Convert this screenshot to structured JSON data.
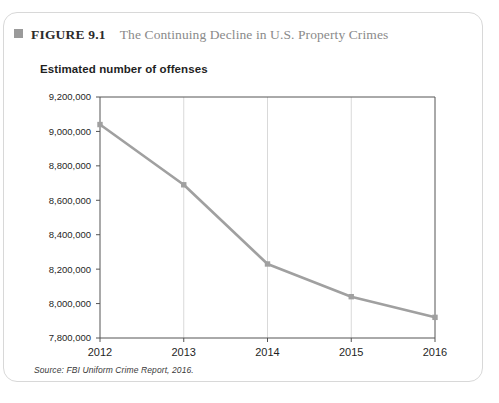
{
  "figure": {
    "bullet_icon": "square-bullet-icon",
    "number_label": "FIGURE 9.1",
    "title": "The Continuing Decline in U.S. Property Crimes",
    "source": "Source: FBI Uniform Crime Report, 2016."
  },
  "colors": {
    "line": "#a0a0a0",
    "marker": "#a0a0a0",
    "axis": "#555555",
    "gridline": "#d9d9d9",
    "card_border": "#d8d8d8",
    "bullet": "#9a9a9a",
    "title_text": "#8a8a8a",
    "number_text": "#2b2b2b"
  },
  "chart_data": {
    "type": "line",
    "title": "Estimated number of offenses",
    "xlabel": "",
    "ylabel": "",
    "categories": [
      "2012",
      "2013",
      "2014",
      "2015",
      "2016"
    ],
    "values": [
      9040000,
      8690000,
      8230000,
      8040000,
      7920000
    ],
    "series": [
      {
        "name": "Estimated number of offenses",
        "values": [
          9040000,
          8690000,
          8230000,
          8040000,
          7920000
        ]
      }
    ],
    "ylim": [
      7800000,
      9200000
    ],
    "ytick_values": [
      7800000,
      8000000,
      8200000,
      8400000,
      8600000,
      8800000,
      9000000,
      9200000
    ],
    "ytick_labels": [
      "7,800,000",
      "8,000,000",
      "8,200,000",
      "8,400,000",
      "8,600,000",
      "8,800,000",
      "9,000,000",
      "9,200,000"
    ],
    "xtick_labels": [
      "2012",
      "2013",
      "2014",
      "2015",
      "2016"
    ],
    "grid": "vertical-only",
    "legend": "none",
    "markers": "square"
  }
}
